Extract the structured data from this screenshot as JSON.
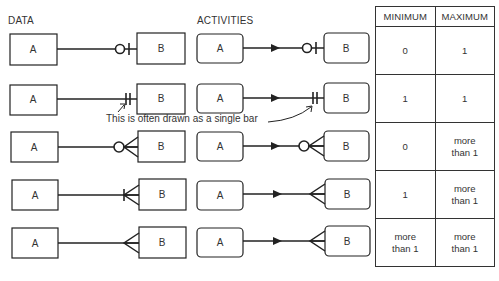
{
  "headers": {
    "data": "DATA",
    "activities": "ACTIVITIES"
  },
  "entities": {
    "a": "A",
    "b": "B"
  },
  "rows": [
    {
      "notation": "zero-or-one",
      "minimum": "0",
      "maximum": "1"
    },
    {
      "notation": "exactly-one",
      "minimum": "1",
      "maximum": "1"
    },
    {
      "notation": "zero-or-many",
      "minimum": "0",
      "maximum": "more than 1"
    },
    {
      "notation": "one-or-many",
      "minimum": "1",
      "maximum": "more than 1"
    },
    {
      "notation": "many-to-many",
      "minimum": "more than 1",
      "maximum": "more than 1"
    }
  ],
  "table": {
    "col_min": "MINIMUM",
    "col_max": "MAXIMUM"
  },
  "annotation": "This is often drawn as a single bar",
  "colors": {
    "line": "#222222",
    "text": "#333333",
    "background": "#ffffff"
  }
}
